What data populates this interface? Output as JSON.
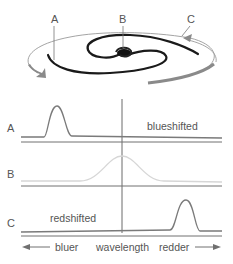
{
  "galaxy": {
    "labels": [
      "A",
      "B",
      "C"
    ]
  },
  "panels": [
    {
      "label": "A",
      "annotation": "blueshifted",
      "peak_position": "left",
      "line_color": "#7a7a7a"
    },
    {
      "label": "B",
      "annotation": "",
      "peak_position": "center",
      "line_color": "#d6d6d6"
    },
    {
      "label": "C",
      "annotation": "redshifted",
      "peak_position": "right",
      "line_color": "#7a7a7a"
    }
  ],
  "axis": {
    "left_label": "bluer",
    "center_label": "wavelength",
    "right_label": "redder"
  },
  "colors": {
    "text": "#555555",
    "lines": "#707070",
    "galaxy_arm": "#1a1a1a",
    "orbit_arrow": "#8a8a8a",
    "faint_peak": "#d6d6d6"
  }
}
